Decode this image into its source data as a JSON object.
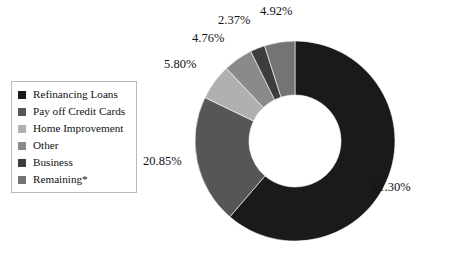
{
  "chart_data": {
    "type": "pie",
    "variant": "donut",
    "title": "",
    "subtitle": "",
    "xlabel": "",
    "ylabel": "",
    "grid": false,
    "legend_position": "left",
    "units": "percent",
    "start_angle_deg": 0,
    "direction": "clockwise",
    "inner_radius_ratio": 0.46,
    "categories": [
      "Refinancing Loans",
      "Pay off Credit Cards",
      "Home Improvement",
      "Other",
      "Business",
      "Remaining*"
    ],
    "values": [
      61.3,
      20.85,
      5.8,
      4.76,
      2.37,
      4.92
    ],
    "value_labels": [
      "61.30%",
      "20.85%",
      "5.80%",
      "4.76%",
      "2.37%",
      "4.92%"
    ],
    "colors": [
      "#1a1a1a",
      "#565656",
      "#b0b0b0",
      "#8a8a8a",
      "#3d3d3d",
      "#747474"
    ],
    "annotations": [
      "*"
    ]
  },
  "legend": {
    "items": [
      {
        "label": "Refinancing Loans",
        "color": "#1a1a1a"
      },
      {
        "label": "Pay off Credit Cards",
        "color": "#565656"
      },
      {
        "label": "Home Improvement",
        "color": "#b0b0b0"
      },
      {
        "label": "Other",
        "color": "#8a8a8a"
      },
      {
        "label": "Business",
        "color": "#3d3d3d"
      },
      {
        "label": "Remaining*",
        "color": "#747474"
      }
    ]
  },
  "labels": {
    "refinancing": "61.30%",
    "payoff": "20.85%",
    "home": "5.80%",
    "other": "4.76%",
    "business": "2.37%",
    "remaining": "4.92%"
  },
  "colors": {
    "background": "#ffffff",
    "text": "#111111",
    "legend_border": "#b9b9b9"
  }
}
